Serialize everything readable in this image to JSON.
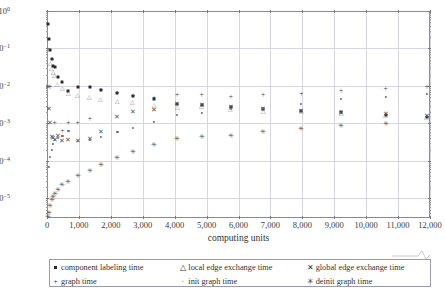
{
  "chart_data": {
    "type": "scatter",
    "title": "",
    "xlabel": "computing units",
    "ylabel": "time [s]",
    "xlim": [
      0,
      12000
    ],
    "ylim": [
      3e-06,
      1.0
    ],
    "yscale": "log",
    "xscale": "linear",
    "grid": true,
    "legend_position": "below",
    "xticks": [
      "0",
      "1,000",
      "2,000",
      "3,000",
      "4,000",
      "5,000",
      "6,000",
      "7,000",
      "8,000",
      "9,000",
      "10,000",
      "11,000",
      "12,000"
    ],
    "xtick_values": [
      0,
      1000,
      2000,
      3000,
      4000,
      5000,
      6000,
      7000,
      8000,
      9000,
      10000,
      11000,
      12000
    ],
    "yticks": [
      "10^0",
      "10^-1",
      "10^-2",
      "10^-3",
      "10^-4",
      "10^-5"
    ],
    "ytick_values": [
      1,
      0.1,
      0.01,
      0.001,
      0.0001,
      1e-05
    ],
    "series": [
      {
        "name": "component labeling time",
        "marker": "square",
        "x": [
          24,
          48,
          96,
          144,
          192,
          240,
          336,
          480,
          672,
          960,
          1344,
          1680,
          2208,
          2688,
          3360,
          4080,
          4848,
          5760,
          6768,
          7968,
          9216,
          10608,
          11904
        ],
        "y": [
          0.45,
          0.175,
          0.093,
          0.053,
          0.035,
          0.033,
          0.0175,
          0.0125,
          0.0072,
          0.0096,
          0.0096,
          0.0076,
          0.0063,
          0.0053,
          0.0044,
          0.0033,
          0.0032,
          0.0027,
          0.0025,
          0.0022,
          0.002,
          0.0017,
          0.0015
        ]
      },
      {
        "name": "local edge exchange time",
        "marker": "triangle",
        "x": [
          96,
          144,
          192,
          240,
          336,
          480,
          672,
          960,
          1344,
          1680,
          2208,
          2688,
          3360,
          4080,
          4848,
          5760,
          6768,
          7968,
          9216,
          10608,
          11904
        ],
        "y": [
          0.04,
          0.031,
          0.024,
          0.02,
          0.0115,
          0.0086,
          0.0066,
          0.0058,
          0.005,
          0.0046,
          0.0039,
          0.0038,
          0.0031,
          0.0028,
          0.0029,
          0.0025,
          0.0022,
          0.0021,
          0.0019,
          0.0017,
          0.0015
        ]
      },
      {
        "name": "global edge exchange time",
        "marker": "cross",
        "x": [
          24,
          48,
          96,
          144,
          192,
          240,
          336,
          480,
          672,
          960,
          1344,
          1680,
          2208,
          2688,
          3360,
          4080,
          4848,
          5760,
          6768,
          7968,
          9216,
          10608,
          11904
        ],
        "y": [
          0.0092,
          0.0024,
          0.00105,
          0.00043,
          0.0004,
          0.00036,
          0.00046,
          0.00035,
          0.00036,
          0.00034,
          0.00038,
          0.00058,
          0.00151,
          0.00205,
          0.00228,
          0.00322,
          0.00312,
          0.0028,
          0.0024,
          0.00215,
          0.0019,
          0.0018,
          0.00155
        ]
      },
      {
        "name": "graph time",
        "marker": "plus",
        "x": [
          96,
          240,
          480,
          672,
          960,
          1344,
          1680,
          2208,
          2688,
          3360,
          4080,
          4848,
          5760,
          6768,
          7968,
          9216,
          10608,
          11904
        ],
        "y": [
          0.0094,
          0.00104,
          0.00061,
          0.001,
          0.00104,
          0.00132,
          0.0076,
          0.0065,
          0.00545,
          0.00485,
          0.0057,
          0.0058,
          0.0052,
          0.0057,
          0.0062,
          0.00735,
          0.0082,
          0.0093
        ]
      },
      {
        "name": "init graph time",
        "marker": "dot",
        "x": [
          48,
          96,
          144,
          192,
          240,
          336,
          480,
          672,
          960,
          1344,
          1680,
          2208,
          2688,
          3360,
          4080,
          4848,
          5760,
          6768,
          7968,
          9216,
          10608,
          11904
        ],
        "y": [
          6.8e-05,
          0.000125,
          0.0002,
          0.00028,
          0.00036,
          0.00041,
          0.00046,
          0.00062,
          0.00034,
          0.00036,
          0.00043,
          0.0006,
          0.00076,
          0.00108,
          0.00165,
          0.0019,
          0.00245,
          0.00255,
          0.00335,
          0.0045,
          0.0052,
          0.006
        ]
      },
      {
        "name": "deinit graph time",
        "marker": "star",
        "x": [
          24,
          48,
          96,
          144,
          192,
          240,
          336,
          480,
          672,
          960,
          1344,
          1680,
          2208,
          2688,
          3360,
          4080,
          4848,
          5760,
          6768,
          7968,
          9216,
          10608
        ],
        "y": [
          3.2e-06,
          4.2e-06,
          6.2e-06,
          9e-06,
          1.1e-05,
          1.35e-05,
          1.7e-05,
          2.25e-05,
          2.75e-05,
          3.9e-05,
          5.3e-05,
          7.8e-05,
          0.00012,
          0.000175,
          0.00026,
          0.000375,
          0.00044,
          0.000455,
          0.0006,
          0.00069,
          0.00087,
          0.00098
        ]
      }
    ]
  },
  "legend": {
    "rows": [
      [
        {
          "marker": "square",
          "label": "component labeling time"
        },
        {
          "marker": "triangle",
          "label": "local edge exchange time"
        },
        {
          "marker": "cross",
          "label": "global edge exchange time"
        }
      ],
      [
        {
          "marker": "plus",
          "label": "graph time"
        },
        {
          "marker": "dot",
          "label": "init graph time"
        },
        {
          "marker": "star",
          "label": "deinit graph time"
        }
      ]
    ]
  }
}
